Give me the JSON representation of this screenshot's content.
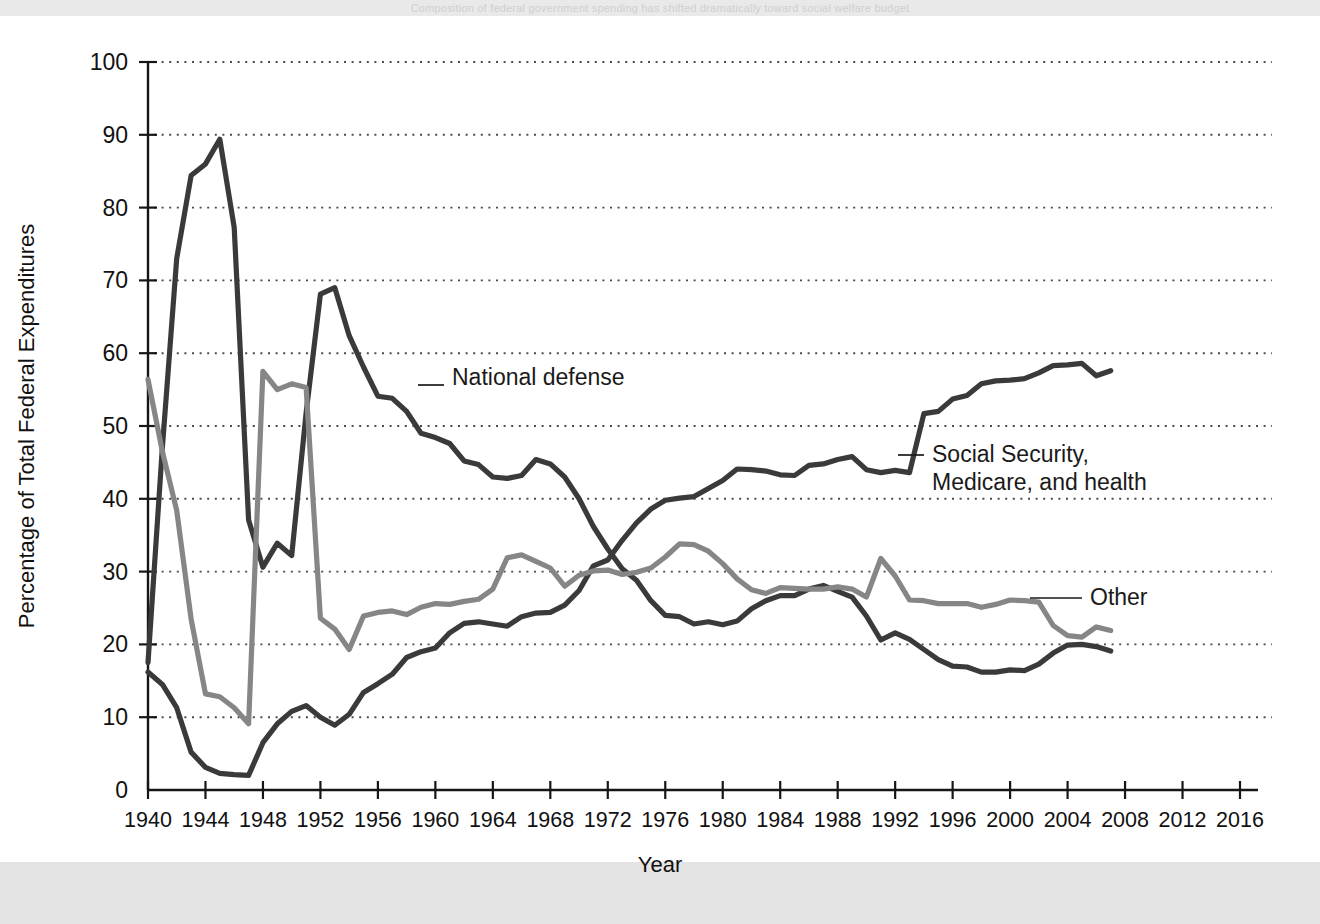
{
  "top_caption": "Composition of federal government spending has shifted dramatically toward social welfare budget",
  "figure": {
    "axes": {
      "x_title": "Year",
      "y_title": "Percentage of Total Federal Expenditures",
      "x_ticks": [
        1940,
        1944,
        1948,
        1952,
        1956,
        1960,
        1964,
        1968,
        1972,
        1976,
        1980,
        1984,
        1988,
        1992,
        1996,
        2000,
        2004,
        2008,
        2012,
        2016
      ],
      "y_ticks": [
        0,
        10,
        20,
        30,
        40,
        50,
        60,
        70,
        80,
        90,
        100
      ],
      "xlim": [
        1940,
        2016
      ],
      "ylim": [
        0,
        100
      ],
      "grid": "horizontal-dotted"
    },
    "annotations": [
      {
        "name": "national-defense",
        "text": "National defense",
        "lines": [
          "National defense"
        ],
        "x": 452,
        "y": 385
      },
      {
        "name": "social-security",
        "text": "Social Security, Medicare, and health",
        "lines": [
          "Social Security,",
          "Medicare, and health"
        ],
        "x": 932,
        "y": 462
      },
      {
        "name": "other",
        "text": "Other",
        "lines": [
          "Other"
        ],
        "x": 1090,
        "y": 605
      }
    ],
    "colors": {
      "national_defense": "#3a3a3a",
      "social_security": "#3a3a3a",
      "other": "#868686",
      "grid": "#4a4a4a",
      "axis": "#161616",
      "plot_background": "#ffffff",
      "page_background": "#e9e9e9"
    }
  },
  "chart_data": {
    "type": "line",
    "title": "",
    "xlabel": "Year",
    "ylabel": "Percentage of Total Federal Expenditures",
    "xlim": [
      1940,
      2016
    ],
    "ylim": [
      0,
      100
    ],
    "grid": true,
    "legend": "inline-annotations",
    "x": [
      1940,
      1941,
      1942,
      1943,
      1944,
      1945,
      1946,
      1947,
      1948,
      1949,
      1950,
      1951,
      1952,
      1953,
      1954,
      1955,
      1956,
      1957,
      1958,
      1959,
      1960,
      1961,
      1962,
      1963,
      1964,
      1965,
      1966,
      1967,
      1968,
      1969,
      1970,
      1971,
      1972,
      1973,
      1974,
      1975,
      1976,
      1977,
      1978,
      1979,
      1980,
      1981,
      1982,
      1983,
      1984,
      1985,
      1986,
      1987,
      1988,
      1989,
      1990,
      1991,
      1992,
      1993,
      1994,
      1995,
      1996,
      1997,
      1998,
      1999,
      2000,
      2001,
      2002,
      2003,
      2004,
      2005,
      2006,
      2007
    ],
    "series": [
      {
        "name": "National defense",
        "color": "#3a3a3a",
        "values": [
          17.5,
          47.1,
          73.0,
          84.4,
          86.0,
          89.4,
          77.3,
          37.1,
          30.6,
          33.9,
          32.2,
          51.8,
          68.1,
          69.0,
          62.4,
          58.1,
          54.1,
          53.8,
          52.0,
          49.0,
          48.4,
          47.6,
          45.2,
          44.7,
          43.0,
          42.8,
          43.2,
          45.4,
          44.8,
          43.0,
          40.0,
          36.2,
          33.1,
          30.4,
          28.8,
          26.0,
          24.0,
          23.8,
          22.8,
          23.1,
          22.7,
          23.2,
          24.9,
          26.0,
          26.7,
          26.7,
          27.6,
          28.1,
          27.3,
          26.5,
          23.9,
          20.6,
          21.6,
          20.7,
          19.3,
          17.9,
          17.0,
          16.9,
          16.2,
          16.2,
          16.5,
          16.4,
          17.3,
          18.8,
          19.9,
          20.0,
          19.7,
          19.1
        ]
      },
      {
        "name": "Social Security, Medicare, and health",
        "color": "#3a3a3a",
        "values": [
          16.2,
          14.5,
          11.3,
          5.2,
          3.1,
          2.3,
          2.1,
          2.0,
          6.5,
          9.1,
          10.8,
          11.6,
          10.0,
          8.9,
          10.4,
          13.4,
          14.6,
          15.9,
          18.2,
          19.0,
          19.5,
          21.6,
          22.9,
          23.1,
          22.8,
          22.5,
          23.8,
          24.3,
          24.4,
          25.4,
          27.4,
          30.8,
          31.6,
          34.3,
          36.7,
          38.6,
          39.8,
          40.1,
          40.3,
          41.4,
          42.5,
          44.1,
          44.0,
          43.8,
          43.3,
          43.2,
          44.6,
          44.8,
          45.4,
          45.8,
          44.0,
          43.6,
          43.9,
          43.6,
          51.7,
          52.0,
          53.7,
          54.2,
          55.8,
          56.2,
          56.3,
          56.5,
          57.3,
          58.3,
          58.4,
          58.6,
          56.9,
          57.6
        ]
      },
      {
        "name": "Other",
        "color": "#868686",
        "values": [
          56.4,
          46.5,
          38.4,
          23.5,
          13.2,
          12.8,
          11.3,
          9.1,
          57.5,
          55.0,
          55.8,
          55.3,
          23.6,
          22.1,
          19.3,
          23.9,
          24.4,
          24.6,
          24.1,
          25.1,
          25.6,
          25.5,
          25.9,
          26.2,
          27.6,
          31.9,
          32.3,
          31.4,
          30.5,
          28.0,
          29.5,
          30.1,
          30.2,
          29.6,
          29.9,
          30.5,
          32.0,
          33.8,
          33.7,
          32.8,
          31.1,
          29.0,
          27.5,
          27.0,
          27.8,
          27.7,
          27.6,
          27.6,
          27.9,
          27.6,
          26.5,
          31.8,
          29.4,
          26.1,
          26.0,
          25.6,
          25.6,
          25.6,
          25.1,
          25.5,
          26.1,
          26.0,
          25.8,
          22.6,
          21.2,
          21.0,
          22.4,
          21.9
        ]
      }
    ]
  }
}
